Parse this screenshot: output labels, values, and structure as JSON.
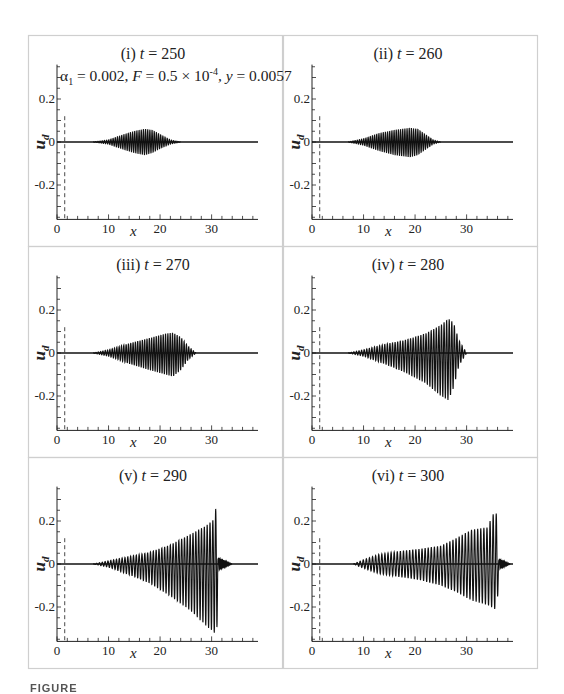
{
  "figure": {
    "caption_partial": "FIGURE",
    "annotation": {
      "alpha": "α",
      "alpha_sub": "1",
      "alpha_val": " = 0.002, ",
      "F": "F",
      "F_val": " = 0.5 × 10",
      "F_exp": "-4",
      "y": ", y",
      "y_val": " = 0.0057"
    }
  },
  "chart_data": [
    {
      "type": "line",
      "panel": "(i)",
      "title_prefix": "(i) ",
      "t_label": "t",
      "title_value": " = 250",
      "xlabel": "x",
      "ylabel": "u",
      "ylabel_sub": "d",
      "xlim": [
        0,
        39
      ],
      "ylim": [
        -0.36,
        0.36
      ],
      "xticks": [
        0,
        10,
        20,
        30
      ],
      "xtick_labels": [
        "0",
        "10",
        "20",
        "30"
      ],
      "yticks": [
        0.2,
        0,
        -0.2
      ],
      "ytick_labels": [
        "0.2",
        "0",
        "-0.2"
      ],
      "dashed_line": {
        "x": 1.5,
        "ymax": 0.12
      },
      "envelope": {
        "start": 7,
        "end": 24,
        "wavelength": 0.42,
        "upper": [
          [
            7,
            0
          ],
          [
            10,
            0.01
          ],
          [
            13,
            0.035
          ],
          [
            15,
            0.05
          ],
          [
            17,
            0.06
          ],
          [
            18.5,
            0.055
          ],
          [
            20,
            0.035
          ],
          [
            22,
            0.01
          ],
          [
            24,
            0
          ]
        ],
        "lower": [
          [
            7,
            0
          ],
          [
            10,
            -0.01
          ],
          [
            13,
            -0.035
          ],
          [
            15,
            -0.05
          ],
          [
            17,
            -0.06
          ],
          [
            18.5,
            -0.05
          ],
          [
            20,
            -0.03
          ],
          [
            22,
            -0.01
          ],
          [
            24,
            0
          ]
        ]
      }
    },
    {
      "type": "line",
      "panel": "(ii)",
      "title_prefix": "(ii) ",
      "t_label": "t",
      "title_value": " = 260",
      "xlabel": "x",
      "ylabel": "u",
      "ylabel_sub": "d",
      "xlim": [
        0,
        39
      ],
      "ylim": [
        -0.36,
        0.36
      ],
      "xticks": [
        0,
        10,
        20,
        30
      ],
      "xtick_labels": [
        "0",
        "10",
        "20",
        "30"
      ],
      "yticks": [
        0.2,
        0,
        -0.2
      ],
      "ytick_labels": [
        "0.2",
        "0",
        "-0.2"
      ],
      "dashed_line": {
        "x": 1.5,
        "ymax": 0.12
      },
      "envelope": {
        "start": 7,
        "end": 25,
        "wavelength": 0.42,
        "upper": [
          [
            7,
            0
          ],
          [
            10,
            0.015
          ],
          [
            13,
            0.04
          ],
          [
            16,
            0.055
          ],
          [
            19,
            0.065
          ],
          [
            20.5,
            0.06
          ],
          [
            22,
            0.035
          ],
          [
            23.5,
            0.01
          ],
          [
            25,
            0
          ]
        ],
        "lower": [
          [
            7,
            0
          ],
          [
            10,
            -0.015
          ],
          [
            13,
            -0.04
          ],
          [
            16,
            -0.06
          ],
          [
            19,
            -0.07
          ],
          [
            20.5,
            -0.06
          ],
          [
            22,
            -0.035
          ],
          [
            23.5,
            -0.01
          ],
          [
            25,
            0
          ]
        ]
      }
    },
    {
      "type": "line",
      "panel": "(iii)",
      "title_prefix": "(iii) ",
      "t_label": "t",
      "title_value": " = 270",
      "xlabel": "x",
      "ylabel": "u",
      "ylabel_sub": "d",
      "xlim": [
        0,
        39
      ],
      "ylim": [
        -0.36,
        0.36
      ],
      "xticks": [
        0,
        10,
        20,
        30
      ],
      "xtick_labels": [
        "0",
        "10",
        "20",
        "30"
      ],
      "yticks": [
        0.2,
        0,
        -0.2
      ],
      "ytick_labels": [
        "0.2",
        "0",
        "-0.2"
      ],
      "dashed_line": {
        "x": 1.5,
        "ymax": 0.12
      },
      "envelope": {
        "start": 7,
        "end": 27,
        "wavelength": 0.45,
        "upper": [
          [
            7,
            0
          ],
          [
            10,
            0.015
          ],
          [
            14,
            0.045
          ],
          [
            18,
            0.07
          ],
          [
            21,
            0.09
          ],
          [
            22.5,
            0.095
          ],
          [
            24,
            0.075
          ],
          [
            25.5,
            0.03
          ],
          [
            27,
            0
          ]
        ],
        "lower": [
          [
            7,
            0
          ],
          [
            10,
            -0.015
          ],
          [
            14,
            -0.05
          ],
          [
            18,
            -0.08
          ],
          [
            21,
            -0.1
          ],
          [
            22.5,
            -0.11
          ],
          [
            24,
            -0.08
          ],
          [
            25.5,
            -0.03
          ],
          [
            27,
            0
          ]
        ]
      }
    },
    {
      "type": "line",
      "panel": "(iv)",
      "title_prefix": "(iv) ",
      "t_label": "t",
      "title_value": " = 280",
      "xlabel": "x",
      "ylabel": "u",
      "ylabel_sub": "d",
      "xlim": [
        0,
        39
      ],
      "ylim": [
        -0.36,
        0.36
      ],
      "xticks": [
        0,
        10,
        20,
        30
      ],
      "xtick_labels": [
        "0",
        "10",
        "20",
        "30"
      ],
      "yticks": [
        0.2,
        0,
        -0.2
      ],
      "ytick_labels": [
        "0.2",
        "0",
        "-0.2"
      ],
      "dashed_line": {
        "x": 1.5,
        "ymax": 0.12
      },
      "envelope": {
        "start": 7,
        "end": 30,
        "wavelength": 0.5,
        "upper": [
          [
            7,
            0
          ],
          [
            10,
            0.015
          ],
          [
            14,
            0.04
          ],
          [
            18,
            0.06
          ],
          [
            22,
            0.09
          ],
          [
            25,
            0.13
          ],
          [
            26.5,
            0.16
          ],
          [
            27.5,
            0.14
          ],
          [
            28.5,
            0.06
          ],
          [
            30,
            0
          ]
        ],
        "lower": [
          [
            7,
            0
          ],
          [
            10,
            -0.015
          ],
          [
            14,
            -0.05
          ],
          [
            18,
            -0.09
          ],
          [
            22,
            -0.14
          ],
          [
            25,
            -0.2
          ],
          [
            26.5,
            -0.22
          ],
          [
            27.5,
            -0.16
          ],
          [
            28.5,
            -0.06
          ],
          [
            30,
            0
          ]
        ]
      }
    },
    {
      "type": "line",
      "panel": "(v)",
      "title_prefix": "(v) ",
      "t_label": "t",
      "title_value": " = 290",
      "xlabel": "x",
      "ylabel": "u",
      "ylabel_sub": "d",
      "xlim": [
        0,
        39
      ],
      "ylim": [
        -0.36,
        0.36
      ],
      "xticks": [
        0,
        10,
        20,
        30
      ],
      "xtick_labels": [
        "0",
        "10",
        "20",
        "30"
      ],
      "yticks": [
        0.2,
        0,
        -0.2
      ],
      "ytick_labels": [
        "0.2",
        "0",
        "-0.2"
      ],
      "dashed_line": {
        "x": 1.5,
        "ymax": 0.12
      },
      "envelope": {
        "start": 7,
        "end": 31.3,
        "wavelength": 0.55,
        "upper": [
          [
            7,
            0
          ],
          [
            10,
            0.015
          ],
          [
            14,
            0.035
          ],
          [
            18,
            0.055
          ],
          [
            22,
            0.09
          ],
          [
            26,
            0.14
          ],
          [
            29,
            0.18
          ],
          [
            30.5,
            0.21
          ],
          [
            31,
            0.29
          ],
          [
            31.3,
            0
          ]
        ],
        "lower": [
          [
            7,
            0
          ],
          [
            10,
            -0.015
          ],
          [
            14,
            -0.05
          ],
          [
            18,
            -0.09
          ],
          [
            22,
            -0.15
          ],
          [
            26,
            -0.22
          ],
          [
            29,
            -0.29
          ],
          [
            30.5,
            -0.32
          ],
          [
            31,
            -0.35
          ],
          [
            31.3,
            0
          ]
        ]
      },
      "tail": {
        "start": 31.3,
        "end": 34,
        "amp": 0.03
      }
    },
    {
      "type": "line",
      "panel": "(vi)",
      "title_prefix": "(vi) ",
      "t_label": "t",
      "title_value": " = 300",
      "xlabel": "x",
      "ylabel": "u",
      "ylabel_sub": "d",
      "xlim": [
        0,
        39
      ],
      "ylim": [
        -0.36,
        0.36
      ],
      "xticks": [
        0,
        10,
        20,
        30
      ],
      "xtick_labels": [
        "0",
        "10",
        "20",
        "30"
      ],
      "yticks": [
        0.2,
        0,
        -0.2
      ],
      "ytick_labels": [
        "0.2",
        "0",
        "-0.2"
      ],
      "dashed_line": {
        "x": 1.5,
        "ymax": 0.12
      },
      "envelope": {
        "start": 8,
        "end": 36.3,
        "wavelength": 0.6,
        "upper": [
          [
            8,
            0
          ],
          [
            10,
            0.02
          ],
          [
            13,
            0.045
          ],
          [
            17,
            0.06
          ],
          [
            21,
            0.07
          ],
          [
            25,
            0.085
          ],
          [
            28,
            0.12
          ],
          [
            31,
            0.16
          ],
          [
            34,
            0.17
          ],
          [
            35.5,
            0.25
          ],
          [
            36,
            0.22
          ],
          [
            36.3,
            0
          ]
        ],
        "lower": [
          [
            8,
            0
          ],
          [
            10,
            -0.02
          ],
          [
            13,
            -0.045
          ],
          [
            17,
            -0.06
          ],
          [
            21,
            -0.075
          ],
          [
            25,
            -0.1
          ],
          [
            28,
            -0.13
          ],
          [
            31,
            -0.17
          ],
          [
            34,
            -0.19
          ],
          [
            35.5,
            -0.21
          ],
          [
            36,
            -0.17
          ],
          [
            36.3,
            0
          ]
        ]
      },
      "tail": {
        "start": 36.3,
        "end": 38.5,
        "amp": 0.025
      }
    }
  ]
}
